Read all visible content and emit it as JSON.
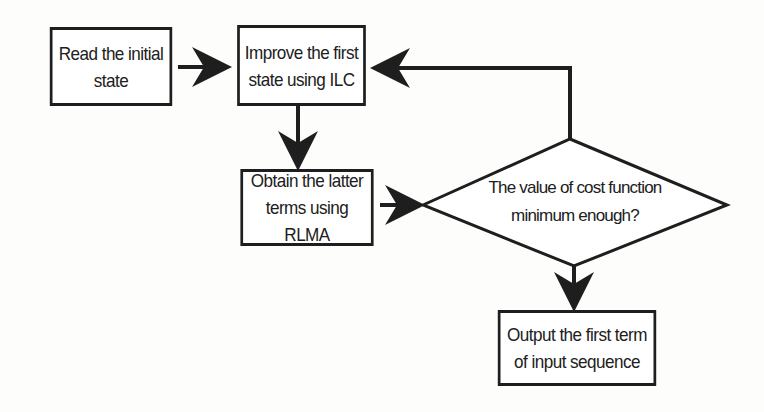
{
  "diagram": {
    "type": "flowchart",
    "colors": {
      "stroke": "#1e1e1e",
      "text": "#202020",
      "background": "#fdfdfb"
    },
    "nodes": [
      {
        "id": "read",
        "shape": "rect",
        "label": "Read the initial\nstate"
      },
      {
        "id": "improve",
        "shape": "rect",
        "label": "Improve the first\nstate using ILC"
      },
      {
        "id": "obtain",
        "shape": "rect",
        "label": "Obtain the latter\nterms using RLMA"
      },
      {
        "id": "decision",
        "shape": "diamond",
        "label": "The value of cost function\nminimum enough?"
      },
      {
        "id": "output",
        "shape": "rect",
        "label": "Output the first term\nof input sequence"
      }
    ],
    "edges": [
      {
        "from": "read",
        "to": "improve"
      },
      {
        "from": "improve",
        "to": "obtain"
      },
      {
        "from": "obtain",
        "to": "decision"
      },
      {
        "from": "decision",
        "to": "improve",
        "note": "feedback loop from top of diamond"
      },
      {
        "from": "decision",
        "to": "output"
      }
    ]
  }
}
